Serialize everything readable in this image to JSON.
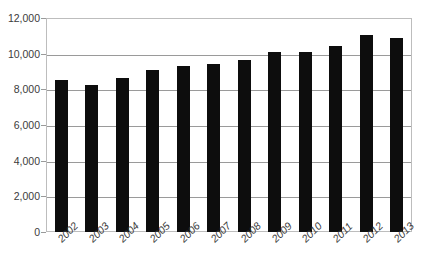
{
  "chart_data": {
    "type": "bar",
    "title": "",
    "xlabel": "",
    "ylabel": "",
    "categories": [
      "2002",
      "2003",
      "2004",
      "2005",
      "2006",
      "2007",
      "2008",
      "2009",
      "2010",
      "2011",
      "2012",
      "2013"
    ],
    "values": [
      8500,
      8250,
      8650,
      9100,
      9300,
      9400,
      9650,
      10100,
      10100,
      10450,
      11050,
      10900
    ],
    "ylim": [
      0,
      12000
    ],
    "ytick_values": [
      0,
      2000,
      4000,
      6000,
      8000,
      10000,
      12000
    ],
    "ytick_labels": [
      "0",
      "2,000",
      "4,000",
      "6,000",
      "8,000",
      "10,000",
      "12,000"
    ],
    "grid": true,
    "legend": null,
    "bar_color": "#0d0d0d",
    "grid_color": "#9a9a9a",
    "frame_color": "#bdbdbd",
    "text_color": "#3b3b3b"
  }
}
